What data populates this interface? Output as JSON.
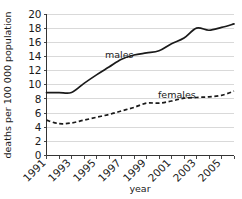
{
  "chart_data": {
    "type": "line",
    "title": "",
    "xlabel": "year",
    "ylabel": "deaths per 100 000 population",
    "xlim": [
      1991,
      2006
    ],
    "ylim": [
      0,
      20
    ],
    "grid": true,
    "legend_position": "inline-labels",
    "x": [
      1991,
      1992,
      1993,
      1994,
      1995,
      1996,
      1997,
      1998,
      1999,
      2000,
      2001,
      2002,
      2003,
      2004,
      2005,
      2006
    ],
    "y_ticks": [
      0,
      2,
      4,
      6,
      8,
      10,
      12,
      14,
      16,
      18,
      20
    ],
    "y_tick_labels": [
      "0",
      "2",
      "4",
      "6",
      "8",
      "10",
      "12",
      "14",
      "16",
      "18",
      "20"
    ],
    "x_ticks": [
      1991,
      1992,
      1993,
      1994,
      1995,
      1996,
      1997,
      1998,
      1999,
      2000,
      2001,
      2002,
      2003,
      2004,
      2005,
      2006
    ],
    "x_tick_labels": [
      "1991",
      "",
      "1993",
      "",
      "1995",
      "",
      "1997",
      "",
      "1999",
      "",
      "2001",
      "",
      "2003",
      "",
      "2005",
      ""
    ],
    "x_labeled_years": [
      "1991",
      "1993",
      "1995",
      "1997",
      "1999",
      "2001",
      "2003",
      "2005"
    ],
    "series": [
      {
        "name": "males",
        "style": "solid",
        "color": "#1a1a1a",
        "label_text": "males",
        "values": [
          8.9,
          8.9,
          8.9,
          10.2,
          11.4,
          12.5,
          13.6,
          14.2,
          14.5,
          14.8,
          15.8,
          16.6,
          18.0,
          17.7,
          18.1,
          18.6
        ]
      },
      {
        "name": "females",
        "style": "dashed",
        "color": "#1a1a1a",
        "label_text": "females",
        "values": [
          5.0,
          4.5,
          4.6,
          5.0,
          5.4,
          5.8,
          6.3,
          6.8,
          7.4,
          7.4,
          7.7,
          8.1,
          8.2,
          8.3,
          8.5,
          9.1
        ]
      }
    ]
  },
  "labels": {
    "males": "males",
    "females": "females",
    "x_axis_title": "year",
    "y_axis_title": "deaths per 100 000 population"
  }
}
